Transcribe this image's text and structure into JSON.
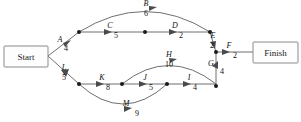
{
  "diagram": {
    "type": "activity-on-arrow-network",
    "terminals": {
      "start": "Start",
      "finish": "Finish"
    },
    "activities": [
      {
        "id": "A",
        "letter": "A",
        "duration": "4",
        "from": "Start",
        "to": "n1"
      },
      {
        "id": "B",
        "letter": "B",
        "duration": "6",
        "from": "n1",
        "to": "n4"
      },
      {
        "id": "C",
        "letter": "C",
        "duration": "5",
        "from": "n1",
        "to": "n2"
      },
      {
        "id": "D",
        "letter": "D",
        "duration": "2",
        "from": "n2",
        "to": "n4"
      },
      {
        "id": "E",
        "letter": "E",
        "duration": "2",
        "from": "n4",
        "to": "n5"
      },
      {
        "id": "F",
        "letter": "F",
        "duration": "2",
        "from": "n5",
        "to": "Finish"
      },
      {
        "id": "G",
        "letter": "G",
        "duration": "4",
        "from": "n9",
        "to": "n5"
      },
      {
        "id": "H",
        "letter": "H",
        "duration": "10",
        "from": "n7",
        "to": "n9"
      },
      {
        "id": "I",
        "letter": "I",
        "duration": "4",
        "from": "n8",
        "to": "n9"
      },
      {
        "id": "J",
        "letter": "J",
        "duration": "5",
        "from": "n7",
        "to": "n8"
      },
      {
        "id": "K",
        "letter": "K",
        "duration": "8",
        "from": "n6",
        "to": "n7"
      },
      {
        "id": "L",
        "letter": "L",
        "duration": "5",
        "from": "Start",
        "to": "n6"
      },
      {
        "id": "M",
        "letter": "M",
        "duration": "9",
        "from": "n6",
        "to": "n8"
      }
    ],
    "nodes": [
      {
        "id": "n1"
      },
      {
        "id": "n2"
      },
      {
        "id": "n4"
      },
      {
        "id": "n5"
      },
      {
        "id": "n6"
      },
      {
        "id": "n7"
      },
      {
        "id": "n8"
      },
      {
        "id": "n9"
      }
    ],
    "colors": {
      "edge": "#6f6f6f",
      "node": "#1a1a1a",
      "box_border": "#8a8a8a",
      "text": "#111111",
      "background": "#ffffff"
    }
  }
}
